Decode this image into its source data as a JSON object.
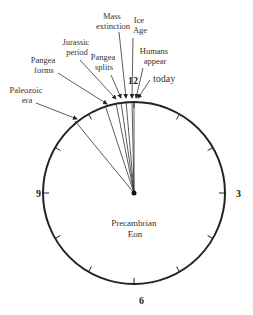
{
  "diagram": {
    "center_label": [
      "Precambrian",
      "Eon"
    ],
    "hour_labels": {
      "twelve": "12",
      "three": "3",
      "six": "6",
      "nine": "9"
    },
    "events": [
      {
        "label": [
          "Paleozoic",
          "era"
        ]
      },
      {
        "label": [
          "Pangea",
          "forms"
        ]
      },
      {
        "label": [
          "Jurassic",
          "period"
        ]
      },
      {
        "label": [
          "Pangea",
          "splits"
        ]
      },
      {
        "label": [
          "Mass",
          "extinction"
        ]
      },
      {
        "label": [
          "Ice",
          "Age"
        ]
      },
      {
        "label": [
          "Humans",
          "appear"
        ]
      },
      {
        "label": [
          "today"
        ]
      }
    ]
  }
}
